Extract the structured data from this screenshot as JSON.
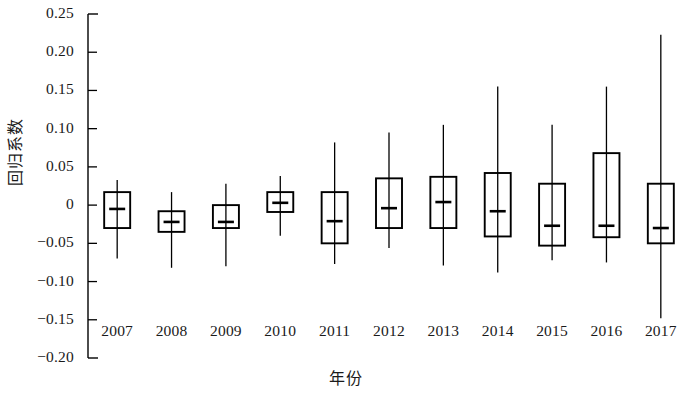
{
  "chart_data": {
    "type": "box",
    "title": "",
    "xlabel": "年份",
    "ylabel": "回归系数",
    "ylim": [
      -0.2,
      0.25
    ],
    "ytick_labels": [
      "0.25",
      "0.20",
      "0.15",
      "0.10",
      "0.05",
      "0",
      "−0.05",
      "−0.10",
      "−0.15",
      "−0.20"
    ],
    "ytick_values": [
      0.25,
      0.2,
      0.15,
      0.1,
      0.05,
      0,
      -0.05,
      -0.1,
      -0.15,
      -0.2
    ],
    "grid": false,
    "legend": "none",
    "categories": [
      "2007",
      "2008",
      "2009",
      "2010",
      "2011",
      "2012",
      "2013",
      "2014",
      "2015",
      "2016",
      "2017"
    ],
    "boxes": [
      {
        "category": "2007",
        "whisker_low": -0.07,
        "q1": -0.03,
        "median": -0.005,
        "q3": 0.017,
        "whisker_high": 0.033
      },
      {
        "category": "2008",
        "whisker_low": -0.082,
        "q1": -0.035,
        "median": -0.022,
        "q3": -0.008,
        "whisker_high": 0.017
      },
      {
        "category": "2009",
        "whisker_low": -0.08,
        "q1": -0.03,
        "median": -0.022,
        "q3": 0.0,
        "whisker_high": 0.028
      },
      {
        "category": "2010",
        "whisker_low": -0.04,
        "q1": -0.009,
        "median": 0.003,
        "q3": 0.017,
        "whisker_high": 0.038
      },
      {
        "category": "2011",
        "whisker_low": -0.077,
        "q1": -0.05,
        "median": -0.021,
        "q3": 0.017,
        "whisker_high": 0.082
      },
      {
        "category": "2012",
        "whisker_low": -0.056,
        "q1": -0.03,
        "median": -0.004,
        "q3": 0.035,
        "whisker_high": 0.095
      },
      {
        "category": "2013",
        "whisker_low": -0.079,
        "q1": -0.03,
        "median": 0.004,
        "q3": 0.037,
        "whisker_high": 0.105
      },
      {
        "category": "2014",
        "whisker_low": -0.088,
        "q1": -0.041,
        "median": -0.008,
        "q3": 0.042,
        "whisker_high": 0.155
      },
      {
        "category": "2015",
        "whisker_low": -0.072,
        "q1": -0.053,
        "median": -0.027,
        "q3": 0.028,
        "whisker_high": 0.105
      },
      {
        "category": "2016",
        "whisker_low": -0.075,
        "q1": -0.042,
        "median": -0.027,
        "q3": 0.068,
        "whisker_high": 0.155
      },
      {
        "category": "2017",
        "whisker_low": -0.148,
        "q1": -0.05,
        "median": -0.03,
        "q3": 0.028,
        "whisker_high": 0.223
      }
    ]
  }
}
